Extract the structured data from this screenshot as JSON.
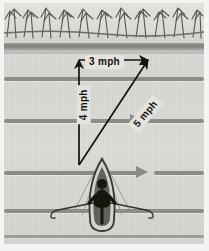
{
  "figure": {
    "type": "vector-diagram-photograph",
    "caption_labels": {
      "current_speed": "3 mph",
      "rowing_speed": "4 mph",
      "resultant_speed": "5 mph"
    }
  },
  "vectors": [
    {
      "name": "current",
      "label": "3 mph",
      "direction": "horizontal-right",
      "magnitude": 3,
      "unit": "mph",
      "start": [
        79,
        60
      ],
      "end": [
        148,
        60
      ]
    },
    {
      "name": "rowing",
      "label": "4 mph",
      "direction": "vertical-up",
      "magnitude": 4,
      "unit": "mph",
      "start": [
        79,
        165
      ],
      "end": [
        79,
        60
      ]
    },
    {
      "name": "resultant",
      "label": "5 mph",
      "direction": "diagonal-up-right",
      "magnitude": 5,
      "unit": "mph",
      "start": [
        79,
        165
      ],
      "end": [
        148,
        60
      ]
    }
  ],
  "scene": {
    "bank_label": "grassy river bank",
    "water_label": "river surface",
    "current_direction": "left to right",
    "boat_label": "rowboat with rower",
    "current_streaks": 5
  },
  "colors": {
    "water": "#d9d9d7",
    "bank": "#dcdbd6",
    "shoreline": "#7f7f7b",
    "streak": "#8c8c88",
    "ink": "#14140f",
    "label_background": "#e4e3e0",
    "page_margin": "#ffffff"
  }
}
